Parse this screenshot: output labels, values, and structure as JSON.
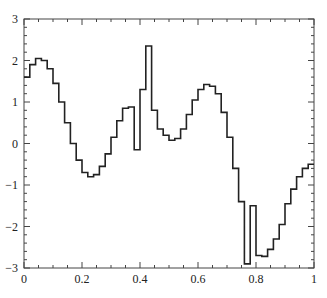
{
  "chart_data": {
    "type": "line",
    "style": "step",
    "title": "",
    "xlabel": "",
    "ylabel": "",
    "xlim": [
      0,
      1
    ],
    "ylim": [
      -3,
      3
    ],
    "x_ticks": [
      "0",
      "0.2",
      "0.4",
      "0.6",
      "0.8",
      "1"
    ],
    "y_ticks": [
      "3",
      "2",
      "1",
      "0",
      "−1",
      "−2",
      "−3"
    ],
    "grid": false,
    "legend": null,
    "bin_width": 0.02,
    "x": [
      0,
      0.02,
      0.04,
      0.06,
      0.08,
      0.1,
      0.12,
      0.14,
      0.16,
      0.18,
      0.2,
      0.22,
      0.24,
      0.26,
      0.28,
      0.3,
      0.32,
      0.34,
      0.36,
      0.38,
      0.4,
      0.42,
      0.44,
      0.46,
      0.48,
      0.5,
      0.52,
      0.54,
      0.56,
      0.58,
      0.6,
      0.62,
      0.64,
      0.66,
      0.68,
      0.7,
      0.72,
      0.74,
      0.76,
      0.78,
      0.8,
      0.82,
      0.84,
      0.86,
      0.88,
      0.9,
      0.92,
      0.94,
      0.96,
      0.98
    ],
    "values": [
      1.6,
      1.9,
      2.05,
      2.0,
      1.8,
      1.45,
      1.0,
      0.5,
      0.0,
      -0.4,
      -0.7,
      -0.8,
      -0.75,
      -0.55,
      -0.25,
      0.15,
      0.55,
      0.85,
      0.88,
      -0.15,
      1.3,
      2.35,
      0.8,
      0.35,
      0.2,
      0.08,
      0.12,
      0.35,
      0.7,
      1.05,
      1.3,
      1.42,
      1.38,
      1.2,
      0.75,
      0.15,
      -0.6,
      -1.4,
      -2.9,
      -1.5,
      -2.7,
      -2.72,
      -2.55,
      -2.3,
      -1.95,
      -1.45,
      -1.1,
      -0.8,
      -0.6,
      -0.5
    ]
  }
}
